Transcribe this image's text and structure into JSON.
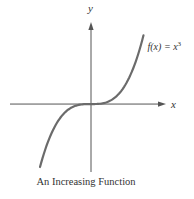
{
  "chart_data": {
    "type": "line",
    "title": "",
    "caption": "An Increasing Function",
    "xlabel": "x",
    "ylabel": "y",
    "grid": false,
    "ticks": false,
    "series": [
      {
        "name": "f(x) = x^3",
        "label_prefix": "f(x) = x",
        "label_exponent": "3",
        "function": "x^3",
        "x": [
          -1.7,
          -1.5,
          -1.25,
          -1.0,
          -0.75,
          -0.5,
          -0.25,
          0,
          0.25,
          0.5,
          0.75,
          1.0,
          1.25,
          1.5,
          1.75
        ],
        "values": [
          -4.913,
          -3.375,
          -1.953,
          -1.0,
          -0.422,
          -0.125,
          -0.016,
          0,
          0.016,
          0.125,
          0.422,
          1.0,
          1.953,
          3.375,
          5.359
        ],
        "color": "#6b6b6b"
      }
    ],
    "xlim": [
      -2.7,
      2.5
    ],
    "ylim": [
      -5.3,
      6.4
    ],
    "legend": "inline-top-right"
  }
}
